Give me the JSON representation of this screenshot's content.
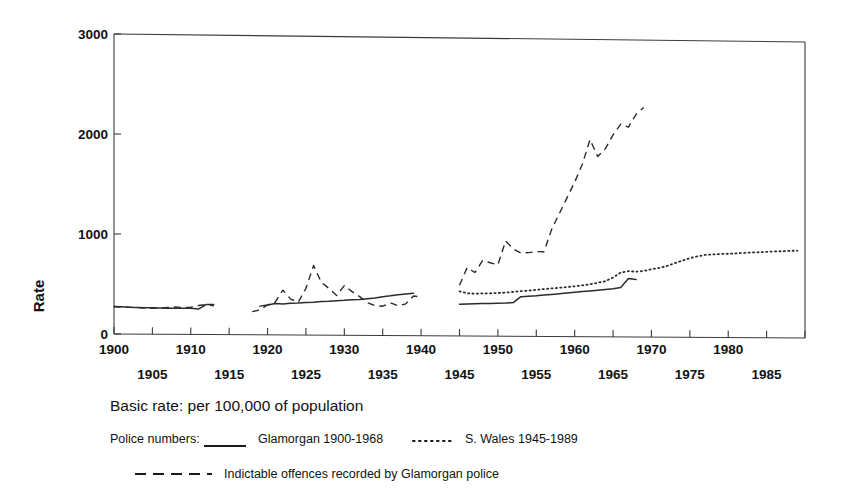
{
  "chart_data": {
    "type": "line",
    "title": "",
    "xlabel": "",
    "ylabel": "Rate",
    "xlim": [
      1900,
      1990
    ],
    "ylim": [
      0,
      3000
    ],
    "grid": false,
    "legend_position": "below-plot",
    "y_ticks": [
      "0",
      "1000",
      "2000",
      "3000"
    ],
    "y_tick_values": [
      0,
      1000,
      2000,
      3000
    ],
    "x_ticks_upper": [
      "1900",
      "1910",
      "1920",
      "1930",
      "1940",
      "1950",
      "1960",
      "1970",
      "1980"
    ],
    "x_ticks_lower": [
      "1905",
      "1915",
      "1925",
      "1935",
      "1945",
      "1955",
      "1965",
      "1975",
      "1985"
    ],
    "x_tick_values_upper": [
      1900,
      1910,
      1920,
      1930,
      1940,
      1950,
      1960,
      1970,
      1980
    ],
    "x_tick_values_lower": [
      1905,
      1915,
      1925,
      1935,
      1945,
      1955,
      1965,
      1975,
      1985
    ],
    "series": [
      {
        "name": "Glamorgan 1900-1968",
        "style": "solid",
        "x": [
          1900,
          1901,
          1902,
          1903,
          1904,
          1905,
          1906,
          1907,
          1908,
          1909,
          1910,
          1911,
          1912,
          1913,
          1919,
          1920,
          1921,
          1922,
          1923,
          1924,
          1925,
          1926,
          1927,
          1928,
          1929,
          1930,
          1931,
          1932,
          1933,
          1934,
          1935,
          1936,
          1937,
          1938,
          1939,
          1945,
          1946,
          1947,
          1948,
          1949,
          1950,
          1951,
          1952,
          1953,
          1954,
          1955,
          1956,
          1957,
          1958,
          1959,
          1960,
          1961,
          1962,
          1963,
          1964,
          1965,
          1966,
          1967,
          1968
        ],
        "y": [
          275,
          272,
          268,
          266,
          265,
          264,
          263,
          262,
          262,
          262,
          263,
          255,
          300,
          302,
          288,
          300,
          315,
          312,
          318,
          322,
          328,
          330,
          338,
          342,
          348,
          352,
          358,
          362,
          370,
          378,
          390,
          400,
          412,
          420,
          428,
          320,
          322,
          325,
          328,
          330,
          332,
          335,
          340,
          400,
          405,
          410,
          418,
          425,
          432,
          440,
          448,
          455,
          462,
          470,
          478,
          485,
          500,
          590,
          580
        ]
      },
      {
        "name": "S. Wales 1945-1989",
        "style": "dotted",
        "x": [
          1945,
          1946,
          1947,
          1948,
          1949,
          1950,
          1951,
          1952,
          1953,
          1954,
          1955,
          1956,
          1957,
          1958,
          1959,
          1960,
          1961,
          1962,
          1963,
          1964,
          1965,
          1966,
          1967,
          1968,
          1969,
          1970,
          1971,
          1972,
          1973,
          1974,
          1975,
          1976,
          1977,
          1978,
          1979,
          1980,
          1981,
          1982,
          1983,
          1984,
          1985,
          1986,
          1987,
          1988,
          1989
        ],
        "y": [
          450,
          430,
          428,
          430,
          432,
          435,
          440,
          448,
          455,
          462,
          470,
          478,
          485,
          492,
          500,
          508,
          518,
          530,
          545,
          562,
          600,
          650,
          665,
          660,
          668,
          685,
          700,
          720,
          748,
          775,
          800,
          820,
          835,
          840,
          845,
          848,
          852,
          858,
          862,
          866,
          870,
          875,
          878,
          882,
          885
        ]
      },
      {
        "name": "Indictable offences recorded by Glamorgan police",
        "style": "dashed",
        "x": [
          1900,
          1901,
          1902,
          1903,
          1904,
          1905,
          1906,
          1907,
          1908,
          1909,
          1910,
          1911,
          1912,
          1913,
          1918,
          1919,
          1920,
          1921,
          1922,
          1923,
          1924,
          1925,
          1926,
          1927,
          1928,
          1929,
          1930,
          1931,
          1932,
          1933,
          1934,
          1935,
          1936,
          1937,
          1938,
          1939,
          1940,
          1945,
          1946,
          1947,
          1948,
          1949,
          1950,
          1951,
          1952,
          1953,
          1954,
          1955,
          1956,
          1957,
          1958,
          1959,
          1960,
          1961,
          1962,
          1963,
          1964,
          1965,
          1966,
          1967,
          1968,
          1969
        ],
        "y": [
          272,
          270,
          268,
          266,
          262,
          260,
          262,
          268,
          275,
          268,
          272,
          290,
          300,
          288,
          232,
          250,
          300,
          330,
          450,
          360,
          330,
          470,
          700,
          530,
          470,
          400,
          500,
          440,
          390,
          330,
          300,
          295,
          330,
          300,
          320,
          400,
          390,
          510,
          690,
          640,
          760,
          740,
          720,
          960,
          880,
          840,
          845,
          855,
          855,
          1080,
          1240,
          1400,
          1560,
          1740,
          1990,
          1820,
          1900,
          2040,
          2150,
          2120,
          2250,
          2320
        ]
      }
    ]
  },
  "axis": {
    "y_label": "Rate"
  },
  "caption": {
    "basic_rate": "Basic rate: per 100,000 of population",
    "police_numbers_prefix": "Police numbers:",
    "legend_glamorgan": "Glamorgan 1900-1968",
    "legend_swales": "S. Wales 1945-1989",
    "legend_indictable": "Indictable offences  recorded by Glamorgan police"
  },
  "colors": {
    "ink": "#2b2b2b",
    "frame": "#3b3b3b",
    "background": "#ffffff"
  }
}
